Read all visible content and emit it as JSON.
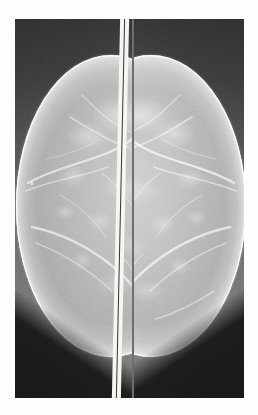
{
  "document": {
    "kind": "radiographic-image",
    "modality": "Mammography",
    "view": "Bilateral craniocaudal (CC)",
    "background_color": "#fdfdfc"
  },
  "film": {
    "frame_color": "#6e6e6e",
    "divider": {
      "name": "film-divider",
      "gap_color": "#f6f5f2",
      "hairline_color": "#1f1f1f"
    }
  },
  "panels": [
    {
      "id": "left",
      "label": "Left CC mammogram",
      "side": "left",
      "background_color": "#565656",
      "tissue_color": "#bcbcbc",
      "skin_line_color": "#ffffff",
      "corner_wedge_color": "#181818"
    },
    {
      "id": "right",
      "label": "Right CC mammogram",
      "side": "right",
      "background_color": "#565656",
      "tissue_color": "#c2c2c2",
      "skin_line_color": "#ffffff",
      "corner_wedge_color": "#181818"
    }
  ],
  "annotations": {
    "marker_speck": {
      "name": "film-marker-speck",
      "color": "#e8e8e8"
    }
  },
  "text": {
    "overlay_labels": [],
    "caption": ""
  }
}
